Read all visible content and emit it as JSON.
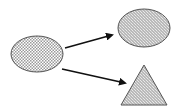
{
  "diagram": {
    "width": 179,
    "height": 111,
    "background": "#ffffff",
    "colors": {
      "stroke": "#555555",
      "arrow": "#111111",
      "pattern": "#8a8a8a"
    },
    "nodes": [
      {
        "id": "source-ellipse",
        "shape": "ellipse",
        "fill": "checkered",
        "cx": 37,
        "cy": 54,
        "rx": 26,
        "ry": 18
      },
      {
        "id": "target-ellipse",
        "shape": "ellipse",
        "fill": "hatched",
        "cx": 144,
        "cy": 28,
        "rx": 26,
        "ry": 19
      },
      {
        "id": "target-triangle",
        "shape": "triangle",
        "fill": "hatched",
        "points": [
          [
            144,
            65
          ],
          [
            121,
            105
          ],
          [
            167,
            105
          ]
        ]
      }
    ],
    "edges": [
      {
        "from": "source-ellipse",
        "to": "target-ellipse",
        "x1": 65,
        "y1": 48,
        "x2": 112,
        "y2": 35
      },
      {
        "from": "source-ellipse",
        "to": "target-triangle",
        "x1": 62,
        "y1": 69,
        "x2": 125,
        "y2": 83
      }
    ]
  }
}
